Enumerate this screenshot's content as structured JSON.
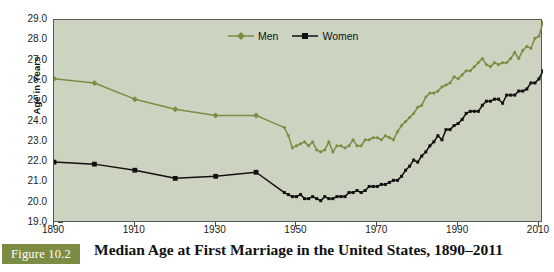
{
  "figure": {
    "badge_label": "Figure 10.2",
    "caption": "Median Age at First Marriage in the United States, 1890–2011"
  },
  "legend": {
    "position": "top-center",
    "entries": [
      {
        "label": "Men",
        "color": "#7d8c43",
        "marker": "diamond"
      },
      {
        "label": "Women",
        "color": "#111111",
        "marker": "square"
      }
    ]
  },
  "colors": {
    "men_line": "#7d8c43",
    "women_line": "#111111",
    "plot_background": "#ccd4c1",
    "page_background": "#ffffff",
    "axis": "#4a4a44",
    "badge_background": "#7d8c43",
    "badge_text": "#ffffff"
  },
  "chart_data": {
    "type": "line",
    "title": "Median Age at First Marriage in the United States, 1890–2011",
    "xlabel": "",
    "ylabel": "Age in Years",
    "xlim": [
      1890,
      2011
    ],
    "ylim": [
      19.0,
      29.0
    ],
    "grid": false,
    "legend_position": "top-center",
    "xticks": [
      1890,
      1910,
      1930,
      1950,
      1970,
      1990,
      2010
    ],
    "xtick_labels": [
      "1890",
      "1910",
      "1930",
      "1950",
      "1970",
      "1990",
      "2010"
    ],
    "yticks": [
      19.0,
      20.0,
      21.0,
      22.0,
      23.0,
      24.0,
      25.0,
      26.0,
      27.0,
      28.0,
      29.0
    ],
    "ytick_labels": [
      "19.0",
      "20.0",
      "21.0",
      "22.0",
      "23.0",
      "24.0",
      "25.0",
      "26.0",
      "27.0",
      "28.0",
      "29.0"
    ],
    "series": [
      {
        "name": "Men",
        "color": "#7d8c43",
        "marker": "diamond",
        "x": [
          1890,
          1900,
          1910,
          1920,
          1930,
          1940,
          1947,
          1948,
          1949,
          1950,
          1951,
          1952,
          1953,
          1954,
          1955,
          1956,
          1957,
          1958,
          1959,
          1960,
          1961,
          1962,
          1963,
          1964,
          1965,
          1966,
          1967,
          1968,
          1969,
          1970,
          1971,
          1972,
          1973,
          1974,
          1975,
          1976,
          1977,
          1978,
          1979,
          1980,
          1981,
          1982,
          1983,
          1984,
          1985,
          1986,
          1987,
          1988,
          1989,
          1990,
          1991,
          1992,
          1993,
          1994,
          1995,
          1996,
          1997,
          1998,
          1999,
          2000,
          2001,
          2002,
          2003,
          2004,
          2005,
          2006,
          2007,
          2008,
          2009,
          2010,
          2011
        ],
        "y": [
          26.1,
          25.9,
          25.1,
          24.6,
          24.3,
          24.3,
          23.7,
          23.3,
          22.7,
          22.8,
          22.9,
          23.0,
          22.8,
          23.0,
          22.6,
          22.5,
          22.6,
          23.0,
          22.5,
          22.8,
          22.8,
          22.7,
          22.8,
          23.1,
          22.8,
          22.8,
          23.1,
          23.1,
          23.2,
          23.2,
          23.1,
          23.3,
          23.2,
          23.1,
          23.5,
          23.8,
          24.0,
          24.2,
          24.4,
          24.7,
          24.8,
          25.2,
          25.4,
          25.4,
          25.5,
          25.7,
          25.8,
          25.9,
          26.2,
          26.1,
          26.3,
          26.5,
          26.5,
          26.7,
          26.9,
          27.1,
          26.8,
          26.7,
          26.9,
          26.8,
          26.9,
          26.9,
          27.1,
          27.4,
          27.1,
          27.5,
          27.7,
          27.6,
          28.1,
          28.2,
          28.9
        ]
      },
      {
        "name": "Women",
        "color": "#111111",
        "marker": "square",
        "x": [
          1890,
          1900,
          1910,
          1920,
          1930,
          1940,
          1947,
          1948,
          1949,
          1950,
          1951,
          1952,
          1953,
          1954,
          1955,
          1956,
          1957,
          1958,
          1959,
          1960,
          1961,
          1962,
          1963,
          1964,
          1965,
          1966,
          1967,
          1968,
          1969,
          1970,
          1971,
          1972,
          1973,
          1974,
          1975,
          1976,
          1977,
          1978,
          1979,
          1980,
          1981,
          1982,
          1983,
          1984,
          1985,
          1986,
          1987,
          1988,
          1989,
          1990,
          1991,
          1992,
          1993,
          1994,
          1995,
          1996,
          1997,
          1998,
          1999,
          2000,
          2001,
          2002,
          2003,
          2004,
          2005,
          2006,
          2007,
          2008,
          2009,
          2010,
          2011
        ],
        "y": [
          22.0,
          21.9,
          21.6,
          21.2,
          21.3,
          21.5,
          20.5,
          20.4,
          20.3,
          20.3,
          20.4,
          20.2,
          20.2,
          20.3,
          20.2,
          20.1,
          20.3,
          20.2,
          20.2,
          20.3,
          20.3,
          20.3,
          20.5,
          20.5,
          20.6,
          20.5,
          20.6,
          20.8,
          20.8,
          20.8,
          20.9,
          20.9,
          21.0,
          21.1,
          21.1,
          21.3,
          21.6,
          21.8,
          22.1,
          22.0,
          22.3,
          22.5,
          22.8,
          23.0,
          23.3,
          23.1,
          23.6,
          23.6,
          23.8,
          23.9,
          24.1,
          24.4,
          24.5,
          24.5,
          24.5,
          24.8,
          25.0,
          25.0,
          25.1,
          25.1,
          24.9,
          25.3,
          25.3,
          25.3,
          25.5,
          25.5,
          25.6,
          25.9,
          25.9,
          26.1,
          26.5
        ]
      }
    ]
  }
}
